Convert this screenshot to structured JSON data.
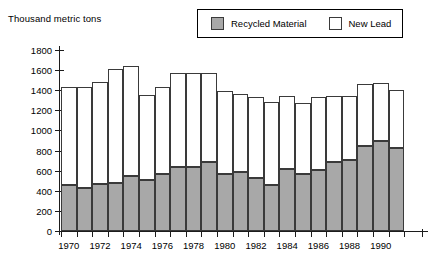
{
  "chart_data": {
    "type": "bar",
    "subtype": "stacked-vertical",
    "title": "Thousand metric tons",
    "xlabel": "",
    "ylabel": "Thousand metric tons",
    "ylim": [
      0,
      1800
    ],
    "yticks": [
      0,
      200,
      400,
      600,
      800,
      1000,
      1200,
      1400,
      1600,
      1800
    ],
    "ytick_labels": [
      "0",
      "200",
      "400",
      "600",
      "800",
      "1000",
      "1200",
      "1400",
      "1600",
      "1800"
    ],
    "grid": false,
    "legend_position": "top-right",
    "categories": [
      1970,
      1971,
      1972,
      1973,
      1974,
      1975,
      1976,
      1977,
      1978,
      1979,
      1980,
      1981,
      1982,
      1983,
      1984,
      1985,
      1986,
      1987,
      1988,
      1989,
      1990,
      1991
    ],
    "xtick_labels": [
      "1970",
      "",
      "1972",
      "",
      "1974",
      "",
      "1976",
      "",
      "1978",
      "",
      "1980",
      "",
      "1982",
      "",
      "1984",
      "",
      "1986",
      "",
      "1988",
      "",
      "1990",
      ""
    ],
    "series": [
      {
        "name": "Recycled Material",
        "color": "#a8a8a8",
        "values": [
          460,
          430,
          470,
          480,
          545,
          510,
          565,
          635,
          635,
          690,
          565,
          590,
          530,
          455,
          620,
          565,
          605,
          690,
          705,
          845,
          895,
          830
        ]
      },
      {
        "name": "New Lead",
        "color": "#ffffff",
        "values": [
          975,
          1005,
          1010,
          1135,
          1095,
          845,
          870,
          940,
          935,
          885,
          825,
          770,
          800,
          830,
          720,
          705,
          725,
          655,
          640,
          615,
          580,
          570
        ]
      }
    ],
    "totals": [
      1435,
      1435,
      1480,
      1615,
      1640,
      1355,
      1435,
      1575,
      1570,
      1575,
      1390,
      1360,
      1330,
      1285,
      1340,
      1270,
      1330,
      1345,
      1460,
      1475,
      1400
    ]
  },
  "legend": {
    "items": [
      {
        "label": "Recycled Material",
        "swatch": "recycled-swatch-icon"
      },
      {
        "label": "New Lead",
        "swatch": "new-lead-swatch-icon"
      }
    ]
  },
  "axis": {
    "y_title": "Thousand metric tons"
  }
}
